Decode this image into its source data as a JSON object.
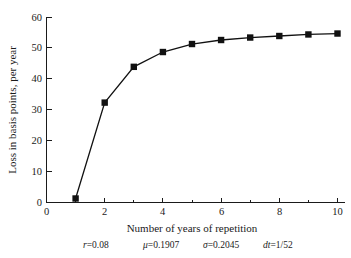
{
  "chart_data": {
    "type": "line",
    "title": "",
    "xlabel": "Number of years of repetition",
    "ylabel": "Loss in basis points, per year",
    "x": [
      1,
      2,
      3,
      4,
      5,
      6,
      7,
      8,
      9,
      10
    ],
    "values": [
      1.3,
      32.4,
      44.0,
      48.8,
      51.4,
      52.7,
      53.5,
      54.0,
      54.5,
      54.8
    ],
    "series": [
      {
        "name": "Loss in basis points",
        "values": [
          1.3,
          32.4,
          44.0,
          48.8,
          51.4,
          52.7,
          53.5,
          54.0,
          54.5,
          54.8
        ]
      }
    ],
    "xlim": [
      0,
      10.45
    ],
    "ylim": [
      0,
      62
    ],
    "xticks": [
      0,
      2,
      4,
      6,
      8,
      10
    ],
    "xtick_labels": [
      "0",
      "2",
      "4",
      "6",
      "8",
      "10"
    ],
    "xminor_ticks": [
      1,
      3,
      5,
      7,
      9
    ],
    "yticks": [
      0,
      10,
      20,
      30,
      40,
      50,
      60
    ],
    "ytick_labels": [
      "0",
      "10",
      "20",
      "30",
      "40",
      "50",
      "60"
    ],
    "grid": false,
    "legend": "none",
    "marker": "square",
    "line_color": "#111111",
    "marker_color": "#111111"
  },
  "caption": {
    "parts": [
      {
        "symbol": "r",
        "equals": "=0.08"
      },
      {
        "symbol": "μ",
        "equals": "=0.1907"
      },
      {
        "symbol": "σ",
        "equals": "=0.2045"
      },
      {
        "symbol": "dt",
        "equals": "=1/52"
      }
    ],
    "full_text": "r=0.08   μ=0.1907   σ=0.2045   dt=1/52"
  }
}
